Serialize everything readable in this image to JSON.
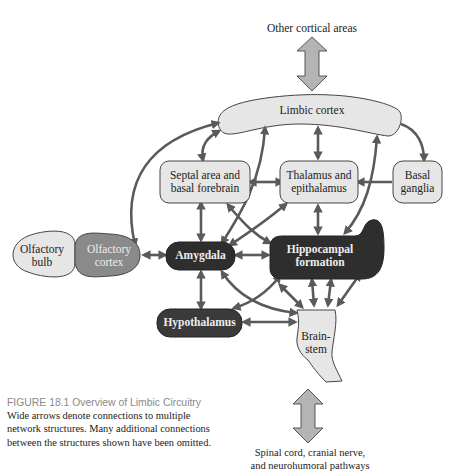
{
  "diagram": {
    "nodes": {
      "other_cortical": "Other cortical areas",
      "limbic_cortex": "Limbic cortex",
      "septal_l1": "Septal area and",
      "septal_l2": "basal forebrain",
      "thalamus_l1": "Thalamus and",
      "thalamus_l2": "epithalamus",
      "basal_l1": "Basal",
      "basal_l2": "ganglia",
      "olf_bulb_l1": "Olfactory",
      "olf_bulb_l2": "bulb",
      "olf_cortex_l1": "Olfactory",
      "olf_cortex_l2": "cortex",
      "amygdala": "Amygdala",
      "hippo_l1": "Hippocampal",
      "hippo_l2": "formation",
      "hypothalamus": "Hypothalamus",
      "brainstem_l1": "Brain-",
      "brainstem_l2": "stem",
      "spinal_l1": "Spinal cord, cranial nerve,",
      "spinal_l2": "and neurohumoral pathways"
    },
    "colors": {
      "light_fill": "#e6e6e6",
      "dark_fill": "#2e2e2e",
      "mid_fill": "#8a8a8a",
      "arrow": "#5a5a5a",
      "wide_arrow": "#b4b4b4"
    }
  },
  "caption": {
    "figure": "FIGURE 18.1  Overview of Limbic Circuitry",
    "text": "  Wide arrows denote connections to multiple network structures. Many additional connections between the structures shown have been omitted."
  }
}
